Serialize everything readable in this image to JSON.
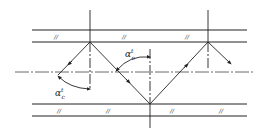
{
  "diagram": {
    "type": "optical-waveguide-ray-propagation",
    "colors": {
      "line": "#222222",
      "background": "#ffffff"
    },
    "labels": {
      "angle_upper": {
        "symbol": "α",
        "sup": "t",
        "sub": "c"
      },
      "angle_lower": {
        "symbol": "α",
        "sup": "t",
        "sub": "c"
      }
    },
    "hatch_mark": "//",
    "top_plate_hatches": 3,
    "bottom_plate_hatches": 4
  }
}
